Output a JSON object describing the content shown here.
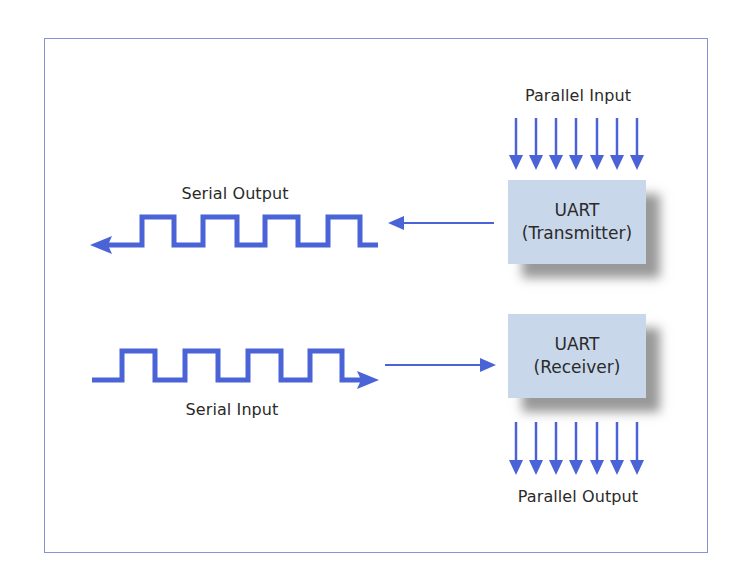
{
  "diagram": {
    "colors": {
      "arrow": "#4a63d6",
      "frame": "#8a92d6",
      "box_fill": "#c9d7ea",
      "shadow": "#777777",
      "text": "#2a2a2a"
    },
    "transmitter": {
      "name": "UART",
      "role": "(Transmitter)",
      "input_label": "Parallel Input",
      "output_label": "Serial Output",
      "parallel_lines": 7
    },
    "receiver": {
      "name": "UART",
      "role": "(Receiver)",
      "input_label": "Serial Input",
      "output_label": "Parallel Output",
      "parallel_lines": 7
    }
  }
}
